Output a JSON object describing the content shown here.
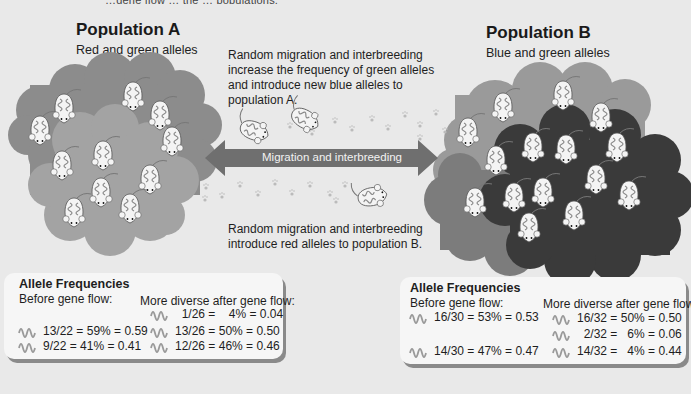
{
  "top_fragment": "…gene flow … the … populations.",
  "population_a": {
    "title": "Population A",
    "subtitle": "Red and green alleles"
  },
  "population_b": {
    "title": "Population B",
    "subtitle": "Blue and green alleles"
  },
  "notes": {
    "to_a": [
      "Random migration and interbreeding",
      "increase the frequency of green alleles",
      "and introduce new blue alleles to",
      "population A."
    ],
    "to_b": [
      "Random migration and interbreeding",
      "introduce red alleles to population B."
    ]
  },
  "arrow": {
    "label": "Migration and interbreeding"
  },
  "freq_a": {
    "title": "Allele Frequencies",
    "before_label": "Before gene flow:",
    "after_label": "More diverse after gene flow:",
    "before": [
      {
        "allele": "red",
        "text": "13/22 = 59% = 0.59"
      },
      {
        "allele": "green",
        "text": " 9/22 =  41% =  0.41"
      }
    ],
    "after": [
      {
        "allele": "blue",
        "text": "  1/26 =    4% = 0.04"
      },
      {
        "allele": "red",
        "text": "13/26 = 50% = 0.50"
      },
      {
        "allele": "green",
        "text": "12/26 = 46% = 0.46"
      }
    ]
  },
  "freq_b": {
    "title": "Allele Frequencies",
    "before_label": "Before gene flow:",
    "after_label": "More diverse after gene flow:",
    "before": [
      {
        "allele": "blue",
        "text": "16/30 = 53% = 0.53"
      },
      {
        "allele": "green",
        "text": "14/30 = 47% = 0.47"
      }
    ],
    "after": [
      {
        "allele": "blue",
        "text": "16/32 = 50% = 0.50"
      },
      {
        "allele": "red",
        "text": "  2/32 =   6% = 0.06"
      },
      {
        "allele": "green",
        "text": "14/32 =   4% = 0.44"
      }
    ]
  },
  "colors": {
    "background": "#e9e9e9",
    "cloud_a_outer": "#8c8c8c",
    "cloud_a_inner": "#a3a3a3",
    "cloud_b_light": "#9a9a9a",
    "cloud_b_mid": "#7c7c7c",
    "cloud_b_dark": "#3a3a3a",
    "arrow": "#6f6f6f",
    "box": "#f6f6f6"
  }
}
